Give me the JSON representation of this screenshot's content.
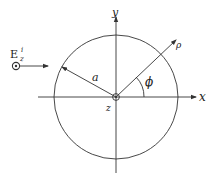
{
  "diagram": {
    "labels": {
      "y_axis": "y",
      "x_axis": "x",
      "z_axis": "z",
      "radius": "a",
      "rho": "ρ",
      "phi": "ϕ",
      "field_E": "E",
      "field_sup": "i",
      "field_sub": "z"
    },
    "elements": [
      "cylinder-cross-section",
      "x-axis",
      "y-axis",
      "z-axis-out-of-page",
      "radius-arrow",
      "rho-arrow",
      "phi-angle-arc",
      "incident-field-arrow"
    ],
    "colors": {
      "ink": "#333333",
      "background": "#ffffff"
    }
  }
}
